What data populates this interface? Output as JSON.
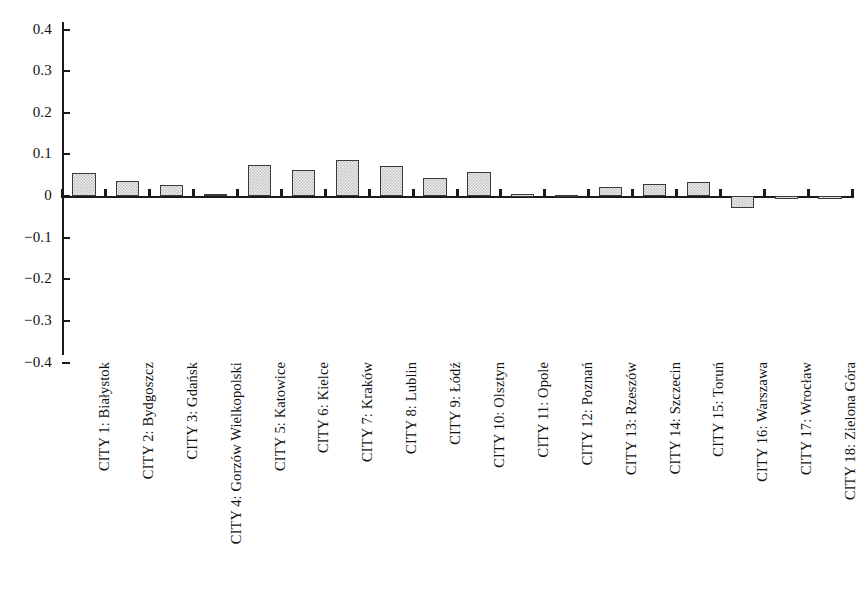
{
  "chart_data": {
    "type": "bar",
    "title": "",
    "subtitle": "",
    "xlabel": "",
    "ylabel": "",
    "ylim": [
      -0.4,
      0.4
    ],
    "grid": false,
    "legend": null,
    "orientation": "vertical",
    "zero_line": true,
    "ytick_labels": [
      "0.4",
      "0.3",
      "0.2",
      "0.1",
      "0",
      "−0.1",
      "−0.2",
      "−0.3",
      "−0.4"
    ],
    "ytick_values": [
      0.4,
      0.3,
      0.2,
      0.1,
      0,
      -0.1,
      -0.2,
      -0.3,
      -0.4
    ],
    "categories": [
      "CITY 1: Białystok",
      "CITY 2: Bydgoszcz",
      "CITY 3: Gdańsk",
      "CITY 4: Gorzów Wielkopolski",
      "CITY 5: Katowice",
      "CITY 6: Kielce",
      "CITY 7: Kraków",
      "CITY 8: Lublin",
      "CITY 9: Łódź",
      "CITY 10: Olsztyn",
      "CITY 11: Opole",
      "CITY 12: Poznań",
      "CITY 13: Rzeszów",
      "CITY 14: Szczecin",
      "CITY 15: Toruń",
      "CITY 16: Warszawa",
      "CITY 17: Wrocław",
      "CITY 18: Zielona Góra"
    ],
    "values": [
      0.056,
      0.037,
      0.026,
      0.006,
      0.074,
      0.063,
      0.086,
      0.071,
      0.043,
      0.057,
      0.004,
      0.003,
      0.021,
      0.029,
      0.034,
      -0.028,
      -0.007,
      -0.002
    ],
    "bar_face_color": "#c9c9c9",
    "bar_edge_color": "#3a3a3a",
    "axis_color": "#1a1a1a"
  },
  "caption": {
    "text": ""
  }
}
